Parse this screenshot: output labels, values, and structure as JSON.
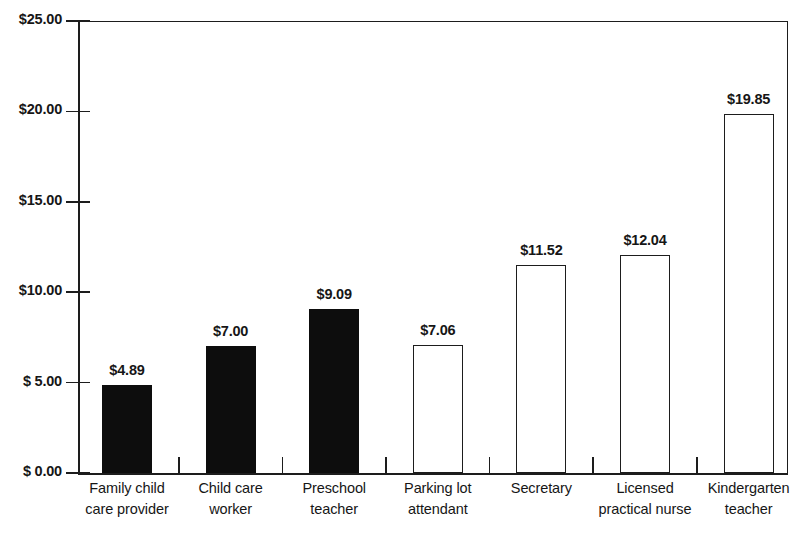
{
  "chart_data": {
    "type": "bar",
    "title": "",
    "xlabel": "",
    "ylabel": "",
    "ylim": [
      0,
      25
    ],
    "grid": false,
    "legend": "none",
    "y_ticks": [
      "$ 0.00",
      "$ 5.00",
      "$10.00",
      "$15.00",
      "$20.00",
      "$25.00"
    ],
    "y_tick_values": [
      0,
      5,
      10,
      15,
      20,
      25
    ],
    "categories": [
      "Family child care provider",
      "Child care worker",
      "Preschool teacher",
      "Parking lot attendant",
      "Secretary",
      "Licensed practical nurse",
      "Kindergarten teacher"
    ],
    "category_lines": [
      [
        "Family child",
        "care provider"
      ],
      [
        "Child care",
        "worker"
      ],
      [
        "Preschool",
        "teacher"
      ],
      [
        "Parking lot",
        "attendant"
      ],
      [
        "Secretary"
      ],
      [
        "Licensed",
        "practical nurse"
      ],
      [
        "Kindergarten",
        "teacher"
      ]
    ],
    "values": [
      4.89,
      7.0,
      9.09,
      7.06,
      11.52,
      12.04,
      19.85
    ],
    "value_labels": [
      "$4.89",
      "$7.00",
      "$9.09",
      "$7.06",
      "$11.52",
      "$12.04",
      "$19.85"
    ],
    "bar_styles": [
      "filled",
      "filled",
      "filled",
      "hollow",
      "hollow",
      "hollow",
      "hollow"
    ],
    "colors": {
      "filled": "#0d0d0d",
      "hollow_fill": "#ffffff",
      "outline": "#1d1d1d",
      "axis": "#1d1d1d",
      "text": "#161616"
    }
  }
}
